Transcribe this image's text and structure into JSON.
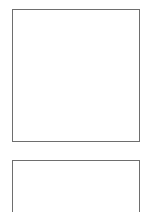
{
  "panels": [
    {
      "id": "panel-1",
      "content": ""
    },
    {
      "id": "panel-2",
      "content": ""
    }
  ],
  "colors": {
    "border": "#6e6e6e",
    "background": "#ffffff"
  }
}
